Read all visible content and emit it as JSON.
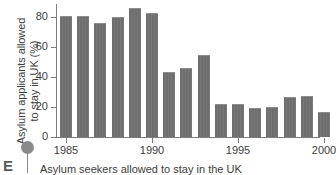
{
  "figure": {
    "marker_letter": "E",
    "caption": "Asylum seekers allowed to stay in the UK",
    "pin_icon": "map-pin-icon"
  },
  "chart_data": {
    "type": "bar",
    "title": "",
    "xlabel": "",
    "ylabel": "Asylum applicants allowed to stay in UK (%)",
    "ylabel_line1": "Asylum applicants allowed",
    "ylabel_line2": "to stay in UK (%)",
    "ylim": [
      0,
      90
    ],
    "yticks": [
      0,
      20,
      40,
      60,
      80
    ],
    "ytick_labels": [
      "0",
      "20",
      "40",
      "60",
      "80"
    ],
    "xticks": [
      1985,
      1990,
      1995,
      2000
    ],
    "xtick_labels": [
      "1985",
      "1990",
      "1995",
      "2000"
    ],
    "grid": false,
    "legend": null,
    "bar_color": "#6e6e6e",
    "axis_color": "#7c7c7c",
    "categories": [
      "1985",
      "1986",
      "1987",
      "1988",
      "1989",
      "1990",
      "1991",
      "1992",
      "1993",
      "1994",
      "1995",
      "1996",
      "1997",
      "1998",
      "1999",
      "2000"
    ],
    "values": [
      81,
      81,
      76,
      80,
      86,
      83,
      43.5,
      46,
      55,
      22,
      22,
      19.5,
      20,
      26.5,
      27.5,
      17
    ]
  }
}
